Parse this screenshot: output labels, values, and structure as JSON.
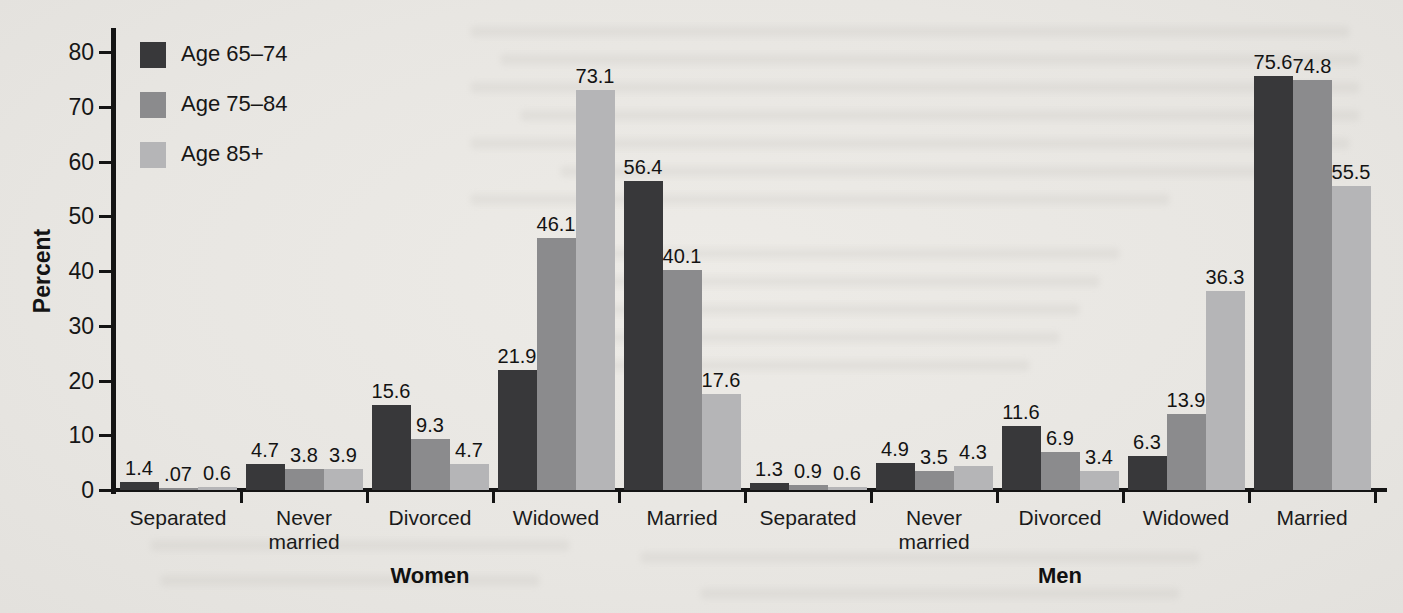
{
  "chart_data": {
    "type": "bar",
    "title": "",
    "ylabel": "Percent",
    "ylim": [
      0,
      84
    ],
    "yticks": [
      0,
      10,
      20,
      30,
      40,
      50,
      60,
      70,
      80
    ],
    "grid": false,
    "legend_position": "top-left-inside",
    "categories": [
      "Separated",
      "Never\nmarried",
      "Divorced",
      "Widowed",
      "Married",
      "Separated",
      "Never\nmarried",
      "Divorced",
      "Widowed",
      "Married"
    ],
    "group_labels": [
      {
        "label": "Women",
        "categories_span": [
          0,
          4
        ]
      },
      {
        "label": "Men",
        "categories_span": [
          5,
          9
        ]
      }
    ],
    "series": [
      {
        "name": "Age 65–74",
        "color": "#38383a",
        "values": [
          1.4,
          4.7,
          15.6,
          21.9,
          56.4,
          1.3,
          4.9,
          11.6,
          6.3,
          75.6
        ],
        "value_labels": [
          "1.4",
          "4.7",
          "15.6",
          "21.9",
          "56.4",
          "1.3",
          "4.9",
          "11.6",
          "6.3",
          "75.6"
        ]
      },
      {
        "name": "Age 75–84",
        "color": "#8b8b8d",
        "values": [
          0.07,
          3.8,
          9.3,
          46.1,
          40.1,
          0.9,
          3.5,
          6.9,
          13.9,
          74.8
        ],
        "value_labels": [
          ".07",
          "3.8",
          "9.3",
          "46.1",
          "40.1",
          "0.9",
          "3.5",
          "6.9",
          "13.9",
          "74.8"
        ]
      },
      {
        "name": "Age 85+",
        "color": "#b5b5b7",
        "values": [
          0.6,
          3.9,
          4.7,
          73.1,
          17.6,
          0.6,
          4.3,
          3.4,
          36.3,
          55.5
        ],
        "value_labels": [
          "0.6",
          "3.9",
          "4.7",
          "73.1",
          "17.6",
          "0.6",
          "4.3",
          "3.4",
          "36.3",
          "55.5"
        ]
      }
    ],
    "axis_color": "#141414",
    "background_color": "#e8e6e2"
  }
}
